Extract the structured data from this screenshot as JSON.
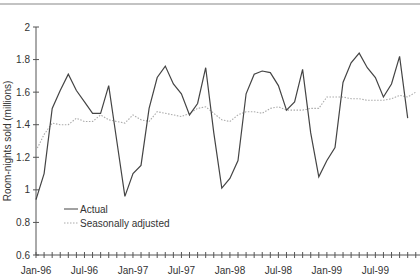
{
  "chart_data": {
    "type": "line",
    "title": "",
    "xlabel": "",
    "ylabel": "Room-nights sold (millions)",
    "ylim": [
      0.6,
      2.0
    ],
    "yticks": [
      0.6,
      0.8,
      1,
      1.2,
      1.4,
      1.6,
      1.8,
      2
    ],
    "ytick_labels": [
      "0.6",
      "0.8",
      "1",
      "1.2",
      "1.4",
      "1.6",
      "1.8",
      "2"
    ],
    "xtick_labels": [
      "Jan-96",
      "Jul-96",
      "Jan-97",
      "Jul-97",
      "Jan-98",
      "Jul-98",
      "Jan-99",
      "Jul-99"
    ],
    "xtick_label_months": [
      0,
      6,
      12,
      18,
      24,
      30,
      36,
      42
    ],
    "n_months": 48,
    "grid": false,
    "legend_position": "lower-left inside plot",
    "series": [
      {
        "name": "Actual",
        "style": "solid",
        "color": "#444444",
        "values": [
          0.94,
          1.1,
          1.5,
          1.61,
          1.71,
          1.61,
          1.54,
          1.47,
          1.47,
          1.64,
          1.3,
          0.96,
          1.1,
          1.15,
          1.5,
          1.69,
          1.76,
          1.65,
          1.59,
          1.46,
          1.53,
          1.75,
          1.35,
          1.01,
          1.07,
          1.18,
          1.59,
          1.71,
          1.73,
          1.72,
          1.64,
          1.49,
          1.54,
          1.74,
          1.35,
          1.08,
          1.18,
          1.26,
          1.66,
          1.78,
          1.84,
          1.75,
          1.69,
          1.57,
          1.65,
          1.82,
          1.44
        ]
      },
      {
        "name": "Seasonally adjusted",
        "style": "dotted",
        "color": "#aaaaaa",
        "values": [
          1.24,
          1.34,
          1.41,
          1.4,
          1.4,
          1.44,
          1.42,
          1.42,
          1.46,
          1.43,
          1.42,
          1.41,
          1.46,
          1.43,
          1.42,
          1.48,
          1.47,
          1.46,
          1.45,
          1.47,
          1.5,
          1.51,
          1.47,
          1.43,
          1.42,
          1.46,
          1.48,
          1.48,
          1.47,
          1.5,
          1.51,
          1.49,
          1.49,
          1.49,
          1.5,
          1.5,
          1.57,
          1.57,
          1.57,
          1.56,
          1.56,
          1.55,
          1.55,
          1.55,
          1.56,
          1.58,
          1.57,
          1.6
        ]
      }
    ]
  },
  "legend": {
    "items": [
      {
        "label": "Actual"
      },
      {
        "label": "Seasonally adjusted"
      }
    ]
  },
  "colors": {
    "top_rule": "#888888",
    "axis": "#555555"
  }
}
